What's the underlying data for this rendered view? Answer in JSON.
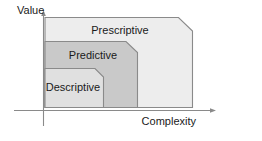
{
  "diagram": {
    "axes": {
      "y_label": "Value",
      "x_label": "Complexity",
      "axis_color": "#8a8a8a"
    },
    "tiers": [
      {
        "id": "prescriptive",
        "label": "Prescriptive",
        "fill": "#ededed",
        "stroke": "#8a8a8a",
        "order": 3
      },
      {
        "id": "predictive",
        "label": "Predictive",
        "fill": "#c9c9c9",
        "stroke": "#8a8a8a",
        "order": 2
      },
      {
        "id": "descriptive",
        "label": "Descriptive",
        "fill": "#e0e0e0",
        "stroke": "#8a8a8a",
        "order": 1
      }
    ]
  }
}
